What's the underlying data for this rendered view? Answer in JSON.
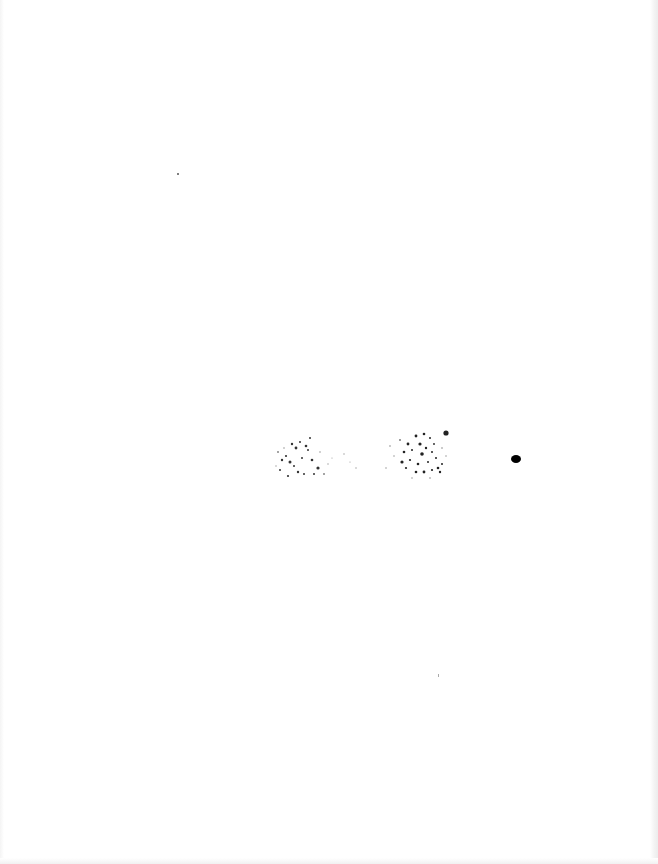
{
  "document": {
    "type": "scanned-page",
    "text_legible": false,
    "content_description": "Nearly blank scanned page with illegible speckled marks near the center"
  },
  "colors": {
    "background": "#ffffff",
    "ink": "#111111",
    "edge_shadow": "#ececec"
  }
}
